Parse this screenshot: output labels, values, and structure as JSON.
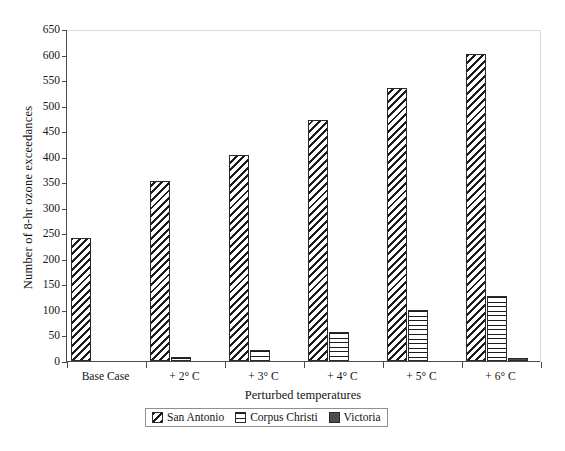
{
  "chart_data": {
    "type": "bar",
    "title": "",
    "xlabel": "Perturbed temperatures",
    "ylabel": "Number of 8-hr ozone exceedances",
    "categories": [
      "Base Case",
      "+ 2° C",
      "+ 3° C",
      "+ 4° C",
      "+ 5° C",
      "+ 6° C"
    ],
    "series": [
      {
        "name": "San Antonio",
        "pattern": "diagonal-hatch",
        "values": [
          241,
          353,
          404,
          472,
          534,
          602
        ]
      },
      {
        "name": "Corpus Christi",
        "pattern": "horizontal-lines",
        "values": [
          0,
          8,
          22,
          57,
          100,
          128
        ]
      },
      {
        "name": "Victoria",
        "pattern": "solid-dark",
        "values": [
          0,
          0,
          0,
          0,
          0,
          5
        ]
      }
    ],
    "ylim": [
      0,
      650
    ],
    "yticks": [
      0,
      50,
      100,
      150,
      200,
      250,
      300,
      350,
      400,
      450,
      500,
      550,
      600,
      650
    ],
    "ytick_labels": [
      "0",
      "50",
      "100",
      "150",
      "200",
      "250",
      "300",
      "350",
      "400",
      "450",
      "500",
      "550",
      "600",
      "650"
    ],
    "grid": false,
    "legend_position": "bottom-center",
    "legend_entries": [
      "San Antonio",
      "Corpus Christi",
      "Victoria"
    ]
  },
  "axis": {
    "y_title": "Number of 8-hr ozone exceedances",
    "x_title": "Perturbed temperatures"
  }
}
